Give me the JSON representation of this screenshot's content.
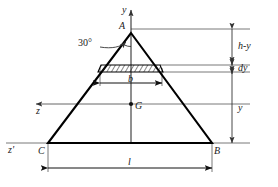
{
  "figure": {
    "type": "engineering-cross-section-diagram",
    "colors": {
      "outline": "#000000",
      "thin_line": "#555555",
      "background": "#ffffff",
      "text": "#1a1a1a"
    }
  },
  "vertices": {
    "apex": "A",
    "bottom_left": "C",
    "bottom_right": "B",
    "centroid": "G"
  },
  "axes": {
    "vertical_axis": "y",
    "horizontal_centroidal_axis": "z",
    "base_axis": "z'"
  },
  "angle": {
    "apex_angle": "30°"
  },
  "dimensions": {
    "strip_width": "b",
    "base_width": "l",
    "distance_above_strip": "h-y",
    "strip_thickness": "dy",
    "distance_to_base": "y"
  }
}
